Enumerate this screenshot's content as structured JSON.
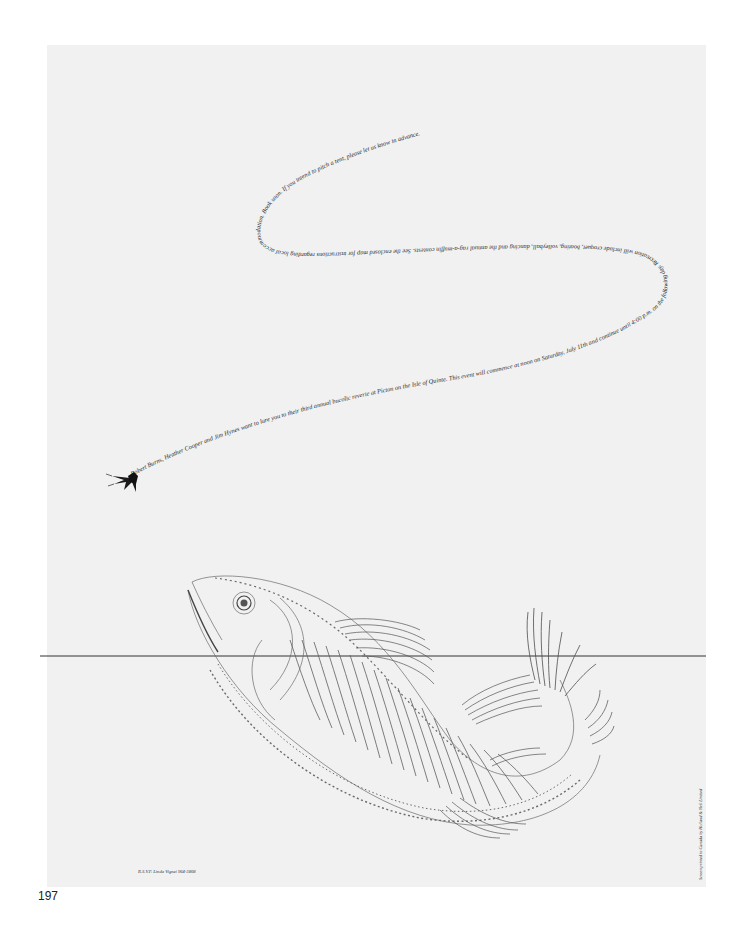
{
  "page": {
    "number": "197"
  },
  "poster": {
    "invitation_text": "Robert Burns, Heather Cooper and Jim Hynes want to lure you to their third annual bucolic reverie at Picton on the Isle of Quinte. This event will commence at noon on Saturday, July 11th and continue until 4:00 p.m. on the following day. Recreation will include croquet, boating, volleyball, dancing and the annual rag-a-muffin contests. See the enclosed map for instructions regarding local accommodation. Book soon. If you intend to pitch a tent, please let us know in advance.",
    "rsvp": "R.S.V.P. Linda Vignei 964-3808",
    "credit": "Screen printed in Canada by Holland & Neil Limited",
    "illustration": {
      "subject": "calligraphic-fish",
      "lure": "fishing-fly",
      "waterline": "horizontal-line"
    }
  },
  "colors": {
    "paper": "#f1f1f1",
    "background": "#ffffff",
    "ink": "#2a2a2a",
    "fish_ink": "#6a6a6a"
  }
}
